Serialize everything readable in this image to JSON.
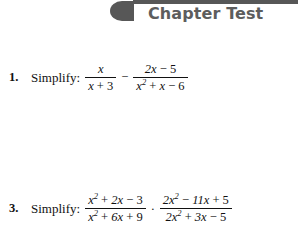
{
  "page": {
    "background_color": "#ffffff",
    "text_color": "#111111"
  },
  "header": {
    "title": "Chapter Test",
    "accent_color": "#575757",
    "title_color": "#5d5d5d",
    "blob_icon": "rounded-tab-shape",
    "rule_icon": "horizontal-rule"
  },
  "problems": [
    {
      "number": "1.",
      "directive": "Simplify:",
      "expression_text": "x/(x + 3) − (2x − 5)/(x² + x − 6)",
      "terms": {
        "frac1": {
          "numerator": "x",
          "denominator_a": "x",
          "denominator_op": "+",
          "denominator_b": "3"
        },
        "operator": "−",
        "frac2": {
          "numerator_a": "2x",
          "numerator_op": "−",
          "numerator_b": "5",
          "denominator_a": "x",
          "denominator_exp": "2",
          "denominator_op1": "+",
          "denominator_b": "x",
          "denominator_op2": "−",
          "denominator_c": "6"
        }
      }
    },
    {
      "number": "3.",
      "directive": "Simplify:",
      "expression_text": "(x² + 2x − 3)/(x² + 6x + 9) · (2x² − 11x + 5)/(2x² + 3x − 5)",
      "terms": {
        "frac1": {
          "numerator_a": "x",
          "numerator_exp": "2",
          "numerator_op1": "+",
          "numerator_b": "2x",
          "numerator_op2": "−",
          "numerator_c": "3",
          "denominator_a": "x",
          "denominator_exp": "2",
          "denominator_op1": "+",
          "denominator_b": "6x",
          "denominator_op2": "+",
          "denominator_c": "9"
        },
        "operator": "·",
        "frac2": {
          "numerator_a": "2x",
          "numerator_exp": "2",
          "numerator_op1": "−",
          "numerator_b": "11x",
          "numerator_op2": "+",
          "numerator_c": "5",
          "denominator_a": "2x",
          "denominator_exp": "2",
          "denominator_op1": "+",
          "denominator_b": "3x",
          "denominator_op2": "−",
          "denominator_c": "5"
        }
      }
    }
  ]
}
